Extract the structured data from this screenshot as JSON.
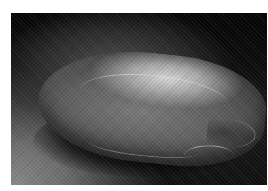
{
  "image": {
    "description": "Grayscale macro photograph of a single elongated grain/seed resting on a textured dark surface",
    "subject": "seed-grain",
    "palette": {
      "background_dark": "#0a0a0a",
      "surface_lit": "#8a8a8a",
      "grain_highlight": "#d8d8d8",
      "grain_body": "#5e5e5e",
      "page_background": "#ffffff"
    }
  }
}
